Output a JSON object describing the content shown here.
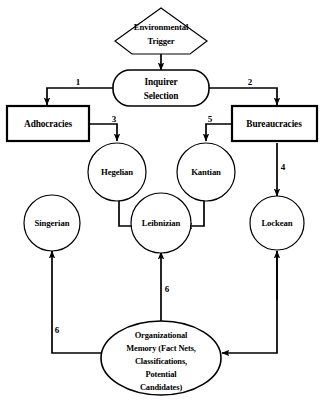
{
  "diagram": {
    "nodes": [
      {
        "id": "environmental-trigger",
        "shape": "pentagon",
        "lines": [
          "Environmental",
          "Trigger"
        ]
      },
      {
        "id": "inquirer-selection",
        "shape": "rounded-rect",
        "lines": [
          "Inquirer",
          "Selection"
        ]
      },
      {
        "id": "adhocracies",
        "shape": "rect",
        "lines": [
          "Adhocracies"
        ]
      },
      {
        "id": "bureaucracies",
        "shape": "rect",
        "lines": [
          "Bureaucracies"
        ]
      },
      {
        "id": "hegelian",
        "shape": "circle",
        "lines": [
          "Hegelian"
        ]
      },
      {
        "id": "kantian",
        "shape": "circle",
        "lines": [
          "Kantian"
        ]
      },
      {
        "id": "singerian",
        "shape": "circle",
        "lines": [
          "Singerian"
        ]
      },
      {
        "id": "leibnizian",
        "shape": "circle",
        "lines": [
          "Leibnizian"
        ]
      },
      {
        "id": "lockean",
        "shape": "circle",
        "lines": [
          "Lockean"
        ]
      },
      {
        "id": "organizational-memory",
        "shape": "ellipse",
        "lines": [
          "Organizational",
          "Memory (Fact Nets,",
          "Classifications,",
          "Potential",
          "Candidates)"
        ]
      }
    ],
    "edge_labels": {
      "trigger_to_inquirer": "",
      "inquirer_to_adhocracies": "1",
      "inquirer_to_bureaucracies": "2",
      "adhocracies_to_hegelian": "3",
      "bureaucracies_to_lockean": "4",
      "bureaucracies_to_kantian": "5",
      "memory_to_leibnizian": "6",
      "memory_to_singerian": "6"
    },
    "colors": {
      "stroke": "#000000",
      "fill": "#ffffff",
      "text": "#000000"
    }
  }
}
